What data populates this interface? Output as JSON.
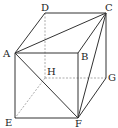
{
  "diagram": {
    "type": "cube",
    "vertices": {
      "A": {
        "label": "A",
        "x": 15,
        "y": 53,
        "lx": 3,
        "ly": 57
      },
      "B": {
        "label": "B",
        "x": 78,
        "y": 53,
        "lx": 81,
        "ly": 60
      },
      "C": {
        "label": "C",
        "x": 106,
        "y": 13,
        "lx": 105,
        "ly": 11
      },
      "D": {
        "label": "D",
        "x": 45,
        "y": 13,
        "lx": 41,
        "ly": 11
      },
      "E": {
        "label": "E",
        "x": 15,
        "y": 118,
        "lx": 5,
        "ly": 126
      },
      "F": {
        "label": "F",
        "x": 78,
        "y": 118,
        "lx": 75,
        "ly": 127
      },
      "G": {
        "label": "G",
        "x": 106,
        "y": 78,
        "lx": 108,
        "ly": 81
      },
      "H": {
        "label": "H",
        "x": 45,
        "y": 78,
        "lx": 47,
        "ly": 75
      }
    },
    "solid_edges": [
      [
        "A",
        "D"
      ],
      [
        "D",
        "C"
      ],
      [
        "C",
        "B"
      ],
      [
        "A",
        "B"
      ],
      [
        "A",
        "E"
      ],
      [
        "E",
        "F"
      ],
      [
        "B",
        "F"
      ],
      [
        "C",
        "G"
      ],
      [
        "G",
        "F"
      ],
      [
        "A",
        "C"
      ],
      [
        "A",
        "F"
      ],
      [
        "C",
        "F"
      ]
    ],
    "hidden_edges": [
      [
        "D",
        "H"
      ],
      [
        "H",
        "E"
      ],
      [
        "H",
        "G"
      ]
    ]
  }
}
